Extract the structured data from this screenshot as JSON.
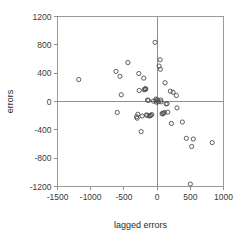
{
  "chart_data": {
    "type": "scatter",
    "title": "",
    "xlabel": "lagged errors",
    "ylabel": "errors",
    "xlim": [
      -1500,
      1000
    ],
    "ylim": [
      -1200,
      1200
    ],
    "xticks": [
      -1500,
      -1000,
      -500,
      0,
      500,
      1000
    ],
    "yticks": [
      -1200,
      -800,
      -400,
      0,
      400,
      800,
      1200
    ],
    "xtick_labels": [
      "-1500",
      "-1000",
      "-500",
      "0",
      "500",
      "1000"
    ],
    "ytick_labels": [
      "-1200",
      "-800",
      "-400",
      "0",
      "400",
      "800",
      "1200"
    ],
    "grid": false,
    "legend": null,
    "reference_lines": {
      "vertical_x": 0,
      "horizontal_y": 0
    },
    "marker": {
      "shape": "circle-open",
      "color": "#4d4d4d",
      "size": 2.1
    },
    "points": [
      {
        "x": -1180,
        "y": 310
      },
      {
        "x": -620,
        "y": 425
      },
      {
        "x": -560,
        "y": 355
      },
      {
        "x": -600,
        "y": -155
      },
      {
        "x": -540,
        "y": 95
      },
      {
        "x": -440,
        "y": 550
      },
      {
        "x": -310,
        "y": -215
      },
      {
        "x": -300,
        "y": -235
      },
      {
        "x": -290,
        "y": -180
      },
      {
        "x": -275,
        "y": 395
      },
      {
        "x": -270,
        "y": 155
      },
      {
        "x": -240,
        "y": -425
      },
      {
        "x": -225,
        "y": -205
      },
      {
        "x": -200,
        "y": 330
      },
      {
        "x": -195,
        "y": 165
      },
      {
        "x": -185,
        "y": 175
      },
      {
        "x": -175,
        "y": 180
      },
      {
        "x": -170,
        "y": 175
      },
      {
        "x": -160,
        "y": -190
      },
      {
        "x": -150,
        "y": -195
      },
      {
        "x": -145,
        "y": 20
      },
      {
        "x": -130,
        "y": 15
      },
      {
        "x": -120,
        "y": -205
      },
      {
        "x": -105,
        "y": -200
      },
      {
        "x": -95,
        "y": -195
      },
      {
        "x": -80,
        "y": -185
      },
      {
        "x": -55,
        "y": 5
      },
      {
        "x": -30,
        "y": 835
      },
      {
        "x": -20,
        "y": 10
      },
      {
        "x": -15,
        "y": 35
      },
      {
        "x": -10,
        "y": -10
      },
      {
        "x": 5,
        "y": 25
      },
      {
        "x": 20,
        "y": -5
      },
      {
        "x": 30,
        "y": 500
      },
      {
        "x": 45,
        "y": 590
      },
      {
        "x": 50,
        "y": 455
      },
      {
        "x": 55,
        "y": 20
      },
      {
        "x": 60,
        "y": -5
      },
      {
        "x": 75,
        "y": -170
      },
      {
        "x": 85,
        "y": -175
      },
      {
        "x": 95,
        "y": -165
      },
      {
        "x": 110,
        "y": -155
      },
      {
        "x": 120,
        "y": 265
      },
      {
        "x": 135,
        "y": -35
      },
      {
        "x": 150,
        "y": -30
      },
      {
        "x": 160,
        "y": -150
      },
      {
        "x": 200,
        "y": 145
      },
      {
        "x": 215,
        "y": -310
      },
      {
        "x": 240,
        "y": 130
      },
      {
        "x": 290,
        "y": 85
      },
      {
        "x": 300,
        "y": -90
      },
      {
        "x": 380,
        "y": -290
      },
      {
        "x": 440,
        "y": -520
      },
      {
        "x": 500,
        "y": -1165
      },
      {
        "x": 520,
        "y": -635
      },
      {
        "x": 545,
        "y": -530
      },
      {
        "x": 830,
        "y": -580
      }
    ]
  },
  "axis": {
    "x_title": "lagged errors",
    "y_title": "errors"
  }
}
